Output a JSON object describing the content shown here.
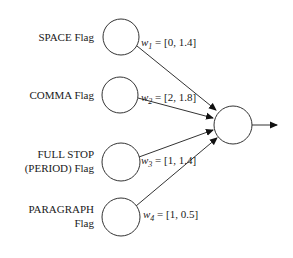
{
  "diagram": {
    "type": "perceptron",
    "inputs": [
      {
        "label_lines": [
          "SPACE Flag"
        ],
        "weight_symbol": "w",
        "weight_index": "1",
        "weight_value": " = [0, 1.4]"
      },
      {
        "label_lines": [
          "COMMA Flag"
        ],
        "weight_symbol": "w",
        "weight_index": "2",
        "weight_value": " = [2, 1.8]"
      },
      {
        "label_lines": [
          "FULL STOP",
          "(PERIOD)  Flag"
        ],
        "weight_symbol": "w",
        "weight_index": "3",
        "weight_value": " = [1, 1.4]"
      },
      {
        "label_lines": [
          "PARAGRAPH",
          "Flag"
        ],
        "weight_symbol": "w",
        "weight_index": "4",
        "weight_value": " = [1, 0.5]"
      }
    ],
    "output_node": "output-neuron",
    "colors": {
      "stroke": "#333333",
      "text": "#1a1a1a",
      "background": "#ffffff"
    }
  }
}
